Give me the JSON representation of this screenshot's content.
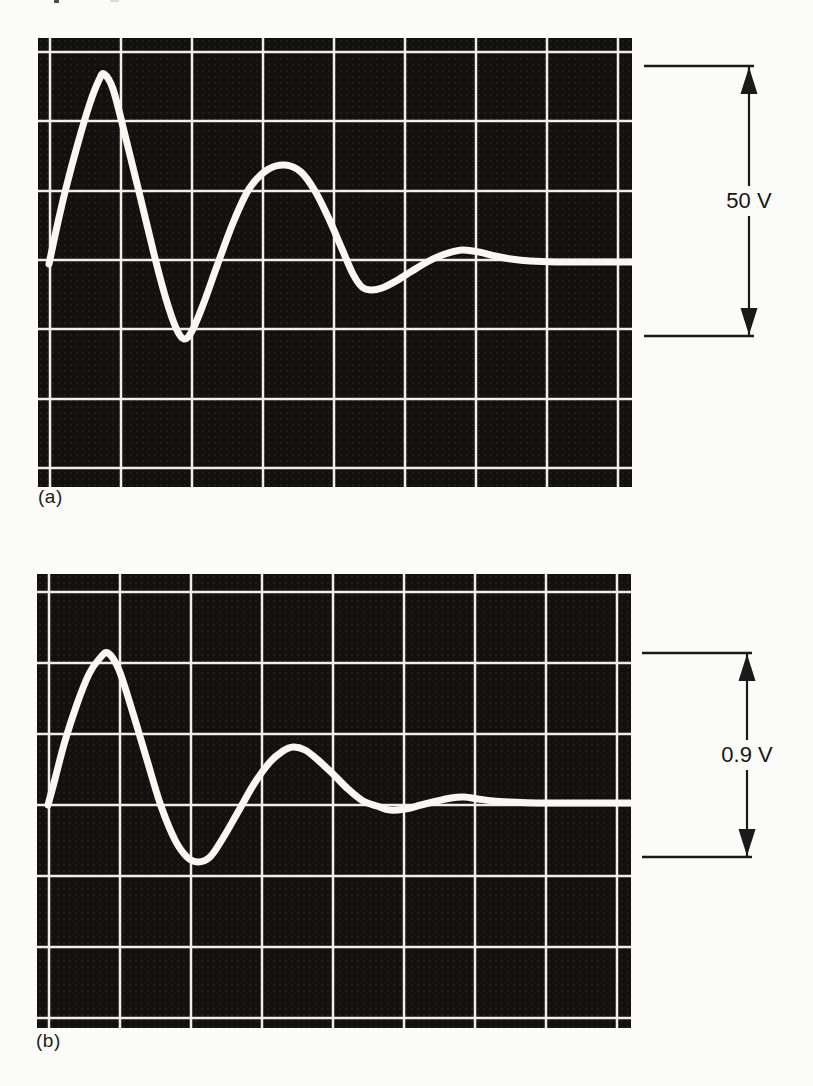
{
  "figure": {
    "panels": [
      {
        "label": "(a)",
        "annotation": {
          "label": "50 V"
        }
      },
      {
        "label": "(b)",
        "annotation": {
          "label": "0.9 V"
        }
      }
    ]
  },
  "colors": {
    "page_background": "#fbfbf9",
    "scope_background": "#131110",
    "graticule": "#efeee8",
    "trace": "#f8f7f3",
    "annotation_ink": "#1a1a1a"
  },
  "chart_data": [
    {
      "type": "line",
      "panel_label": "(a)",
      "annotation_label": "50 V",
      "annotation_meaning": "peak-to-trough amplitude of the decaying oscillation",
      "x_axis": "time (no scale markings shown)",
      "y_axis": "voltage (scope graticule, no numeric ticks shown)",
      "screen": {
        "width_px": 594,
        "height_px": 449,
        "v_lines_px": [
          12,
          83,
          154,
          225,
          296,
          367,
          438,
          509,
          580
        ],
        "h_lines_px": [
          14,
          83,
          153,
          222,
          291,
          361,
          430
        ],
        "grid_note": "oscilloscope graticule, divisions ~71 px, cropped at edges"
      },
      "baseline_y_px": 224,
      "calibration": {
        "label": "50 V",
        "top_px": 28,
        "bottom_px": 298,
        "volts_per_px": 0.185
      },
      "trace_points_px": [
        [
          11,
          226
        ],
        [
          18,
          193
        ],
        [
          28,
          150
        ],
        [
          40,
          105
        ],
        [
          52,
          65
        ],
        [
          61,
          42
        ],
        [
          66,
          36
        ],
        [
          75,
          51
        ],
        [
          88,
          101
        ],
        [
          102,
          158
        ],
        [
          116,
          216
        ],
        [
          128,
          261
        ],
        [
          138,
          290
        ],
        [
          146,
          301
        ],
        [
          154,
          293
        ],
        [
          165,
          267
        ],
        [
          179,
          228
        ],
        [
          195,
          185
        ],
        [
          211,
          151
        ],
        [
          229,
          132
        ],
        [
          247,
          127
        ],
        [
          263,
          134
        ],
        [
          277,
          153
        ],
        [
          291,
          181
        ],
        [
          304,
          211
        ],
        [
          315,
          236
        ],
        [
          324,
          249
        ],
        [
          333,
          252
        ],
        [
          344,
          250
        ],
        [
          358,
          243
        ],
        [
          374,
          233
        ],
        [
          391,
          223
        ],
        [
          407,
          216
        ],
        [
          424,
          212
        ],
        [
          441,
          214
        ],
        [
          457,
          218
        ],
        [
          473,
          221
        ],
        [
          492,
          223
        ],
        [
          518,
          224
        ],
        [
          560,
          224
        ],
        [
          594,
          224
        ]
      ],
      "key_points_volts": [
        {
          "feature": "first peak",
          "volts": 35
        },
        {
          "feature": "first trough",
          "volts": -14
        },
        {
          "feature": "second peak",
          "volts": 18
        },
        {
          "feature": "second trough",
          "volts": -5
        },
        {
          "feature": "third peak",
          "volts": 2
        },
        {
          "feature": "settled level",
          "volts": 0
        }
      ]
    },
    {
      "type": "line",
      "panel_label": "(b)",
      "annotation_label": "0.9 V",
      "annotation_meaning": "peak-to-trough amplitude of the decaying oscillation",
      "x_axis": "time (no scale markings shown)",
      "y_axis": "voltage (scope graticule, no numeric ticks shown)",
      "screen": {
        "width_px": 594,
        "height_px": 454,
        "v_lines_px": [
          12,
          83,
          154,
          225,
          296,
          367,
          438,
          509,
          580
        ],
        "h_lines_px": [
          18,
          89,
          160,
          231,
          302,
          373,
          444
        ],
        "grid_note": "oscilloscope graticule, divisions ~71 px, cropped at edges"
      },
      "baseline_y_px": 231,
      "calibration": {
        "label": "0.9 V",
        "top_px": 79,
        "bottom_px": 283,
        "volts_per_px": 0.00441
      },
      "trace_points_px": [
        [
          11,
          231
        ],
        [
          18,
          205
        ],
        [
          28,
          167
        ],
        [
          40,
          130
        ],
        [
          52,
          100
        ],
        [
          63,
          84
        ],
        [
          71,
          79
        ],
        [
          82,
          96
        ],
        [
          95,
          136
        ],
        [
          110,
          186
        ],
        [
          124,
          232
        ],
        [
          138,
          266
        ],
        [
          150,
          283
        ],
        [
          161,
          288
        ],
        [
          173,
          283
        ],
        [
          186,
          264
        ],
        [
          201,
          238
        ],
        [
          217,
          210
        ],
        [
          233,
          188
        ],
        [
          246,
          177
        ],
        [
          256,
          173
        ],
        [
          268,
          176
        ],
        [
          281,
          186
        ],
        [
          296,
          200
        ],
        [
          311,
          215
        ],
        [
          326,
          227
        ],
        [
          340,
          232
        ],
        [
          353,
          236
        ],
        [
          368,
          235
        ],
        [
          384,
          231
        ],
        [
          400,
          227
        ],
        [
          414,
          224
        ],
        [
          427,
          223
        ],
        [
          441,
          225
        ],
        [
          456,
          227
        ],
        [
          473,
          228
        ],
        [
          500,
          229
        ],
        [
          550,
          229
        ],
        [
          594,
          229
        ]
      ],
      "key_points_volts": [
        {
          "feature": "first peak",
          "volts": 0.67
        },
        {
          "feature": "first trough",
          "volts": -0.25
        },
        {
          "feature": "second peak",
          "volts": 0.26
        },
        {
          "feature": "second trough",
          "volts": -0.03
        },
        {
          "feature": "third peak",
          "volts": 0.04
        },
        {
          "feature": "settled level",
          "volts": 0.01
        }
      ]
    }
  ]
}
